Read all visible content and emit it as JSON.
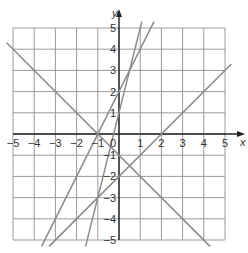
{
  "chart_data": {
    "type": "line",
    "title": "",
    "xlabel": "x",
    "ylabel": "y",
    "xlim": [
      -5,
      5
    ],
    "ylim": [
      -5,
      5
    ],
    "grid": true,
    "x_ticks": [
      "−5",
      "−4",
      "−3",
      "−2",
      "−1",
      "0",
      "1",
      "2",
      "3",
      "4",
      "5"
    ],
    "y_ticks": [
      "5",
      "4",
      "3",
      "2",
      "1",
      "−1",
      "−2",
      "−3",
      "−4",
      "−5"
    ],
    "series": [
      {
        "name": "y = −x − 1",
        "points": [
          [
            -5.3,
            4.3
          ],
          [
            4.3,
            -5.3
          ]
        ]
      },
      {
        "name": "y = x − 2",
        "points": [
          [
            -3.3,
            -5.3
          ],
          [
            5.3,
            3.3
          ]
        ]
      },
      {
        "name": "y = 2x + 2",
        "points": [
          [
            -3.65,
            -5.3
          ],
          [
            1.65,
            5.3
          ]
        ]
      },
      {
        "name": "y = 4x + 1",
        "points": [
          [
            -1.575,
            -5.3
          ],
          [
            1.075,
            5.3
          ]
        ]
      }
    ],
    "line_color": "#8a8a8a",
    "grid_color": "#9a9a9a",
    "axis_color": "#222222"
  }
}
